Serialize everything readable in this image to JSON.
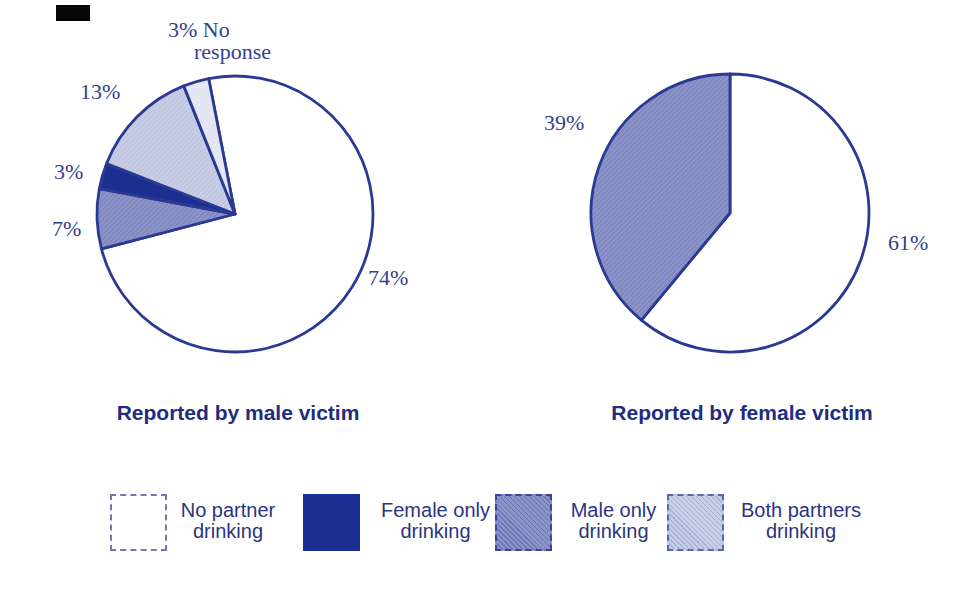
{
  "page": {
    "background": "#ffffff"
  },
  "colors": {
    "outline": "#2a3a94",
    "dark_navy": "#1c2f91",
    "male_only_fill": "#8b93c7",
    "both_partners_fill": "#c7cde4",
    "no_response_fill": "#e4e7f3",
    "white_fill": "#ffffff",
    "percent_text": "#353f8e",
    "title_text": "#1e2d80",
    "legend_text": "#2a3480"
  },
  "chart_data": [
    {
      "type": "pie",
      "title": "Reported by male victim",
      "direction": "clockwise",
      "start_angle_deg": -11,
      "slices": [
        {
          "label": "No partner drinking",
          "value": 74,
          "display": "74%",
          "fill": "#ffffff",
          "hatch": "none"
        },
        {
          "label": "Male only drinking",
          "value": 7,
          "display": "7%",
          "fill": "#8b93c7",
          "hatch": "diag-med"
        },
        {
          "label": "Female only drinking",
          "value": 3,
          "display": "3%",
          "fill": "#1c2f91",
          "hatch": "none"
        },
        {
          "label": "Both partners drinking",
          "value": 13,
          "display": "13%",
          "fill": "#c7cde4",
          "hatch": "diag-light"
        },
        {
          "label": "No response",
          "value": 3,
          "display": "3%",
          "display_lines": [
            "3% No",
            "response"
          ],
          "fill": "#e4e7f3",
          "hatch": "none"
        }
      ]
    },
    {
      "type": "pie",
      "title": "Reported by female victim",
      "direction": "clockwise",
      "start_angle_deg": 0,
      "slices": [
        {
          "label": "No partner drinking",
          "value": 61,
          "display": "61%",
          "fill": "#ffffff",
          "hatch": "none"
        },
        {
          "label": "Male only drinking",
          "value": 39,
          "display": "39%",
          "fill": "#8b93c7",
          "hatch": "diag-med"
        }
      ]
    }
  ],
  "legend": {
    "items": [
      {
        "swatch": "white",
        "lines": [
          "No partner",
          "drinking"
        ]
      },
      {
        "swatch": "dark-navy",
        "lines": [
          "Female only",
          "drinking"
        ]
      },
      {
        "swatch": "male-hatch",
        "lines": [
          "Male only",
          "drinking"
        ]
      },
      {
        "swatch": "light-hatch",
        "lines": [
          "Both partners",
          "drinking"
        ]
      }
    ]
  }
}
